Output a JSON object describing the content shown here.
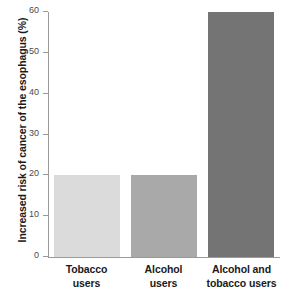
{
  "chart_data": {
    "type": "bar",
    "title": "",
    "xlabel": "",
    "ylabel": "Increased risk of cancer of the esophagus (%)",
    "ylim": [
      0,
      60
    ],
    "grid": false,
    "legend": "none",
    "orientation": "vertical",
    "categories": [
      "Tobacco users",
      "Alcohol users",
      "Alcohol and tobacco users"
    ],
    "category_lines": [
      [
        "Tobacco",
        "users"
      ],
      [
        "Alcohol",
        "users"
      ],
      [
        "Alcohol and",
        "tobacco users"
      ]
    ],
    "values": [
      20,
      20,
      60
    ],
    "bar_colors": [
      "#dbdbdb",
      "#a9a9a9",
      "#747474"
    ],
    "y_ticks": [
      0,
      10,
      20,
      30,
      40,
      50,
      60
    ],
    "y_tick_labels": [
      "0",
      "10",
      "20",
      "30",
      "40",
      "50",
      "60"
    ],
    "axis_color": "#9a9a9a",
    "background_color": "#ffffff",
    "text_color": "#1a1a1a"
  }
}
